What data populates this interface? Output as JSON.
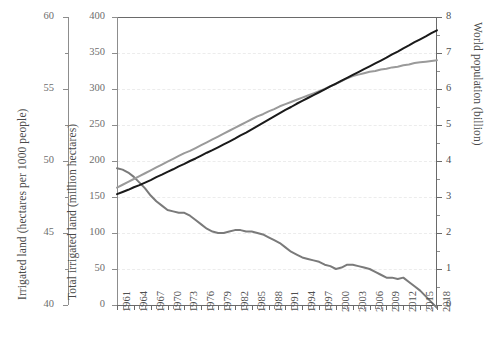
{
  "chart_data": {
    "type": "line",
    "title": "",
    "xlabel": "",
    "x": [
      1961,
      1962,
      1963,
      1964,
      1965,
      1966,
      1967,
      1968,
      1969,
      1970,
      1971,
      1972,
      1973,
      1974,
      1975,
      1976,
      1977,
      1978,
      1979,
      1980,
      1981,
      1982,
      1983,
      1984,
      1985,
      1986,
      1987,
      1988,
      1989,
      1990,
      1991,
      1992,
      1993,
      1994,
      1995,
      1996,
      1997,
      1998,
      1999,
      2000,
      2001,
      2002,
      2003,
      2004,
      2005,
      2006,
      2007,
      2008,
      2009,
      2010,
      2011,
      2012,
      2013,
      2014,
      2015,
      2016,
      2017,
      2018
    ],
    "xtick_labels": [
      "1961",
      "1964",
      "1967",
      "1970",
      "1973",
      "1976",
      "1979",
      "1982",
      "1985",
      "1988",
      "1991",
      "1994",
      "1997",
      "2000",
      "2003",
      "2006",
      "2009",
      "2012",
      "2015",
      "2018"
    ],
    "xtick_step_years": 3,
    "grid": true,
    "grid_style": "horizontal dashed light-grey",
    "legend": "none",
    "axes": [
      {
        "id": "left-secondary",
        "position": "far-left",
        "label": "Irrigated land (hectares per 1000 people)",
        "ticks": [
          40,
          45,
          50,
          55,
          60
        ],
        "minor_ticks": [
          42.5,
          47.5,
          52.5,
          57.5
        ],
        "range": [
          40,
          60
        ]
      },
      {
        "id": "left-primary",
        "position": "left",
        "label": "Total irrigated land (million hectares)",
        "ticks": [
          0,
          50,
          100,
          150,
          200,
          250,
          300,
          350,
          400
        ],
        "range": [
          0,
          400
        ]
      },
      {
        "id": "right",
        "position": "right",
        "label": "World population (billion)",
        "ticks": [
          0,
          1,
          2,
          3,
          4,
          5,
          6,
          7,
          8
        ],
        "minor_ticks": [
          0.5,
          1.5,
          2.5,
          3.5,
          4.5,
          5.5,
          6.5,
          7.5
        ],
        "range": [
          0,
          8
        ]
      }
    ],
    "series": [
      {
        "name": "Irrigated land (hectares per 1000 people)",
        "axis": "left-secondary",
        "color": "#7a7a7a",
        "line_width": 2,
        "values": [
          49.5,
          49.4,
          49.2,
          48.9,
          48.5,
          48.1,
          47.6,
          47.2,
          46.9,
          46.6,
          46.5,
          46.4,
          46.4,
          46.2,
          45.9,
          45.6,
          45.3,
          45.1,
          45.0,
          45.0,
          45.1,
          45.2,
          45.2,
          45.1,
          45.1,
          45.0,
          44.9,
          44.7,
          44.5,
          44.3,
          44.0,
          43.7,
          43.5,
          43.3,
          43.2,
          43.1,
          43.0,
          42.8,
          42.7,
          42.5,
          42.6,
          42.8,
          42.8,
          42.7,
          42.6,
          42.5,
          42.3,
          42.1,
          41.9,
          41.9,
          41.8,
          41.9,
          41.6,
          41.3,
          41.0,
          40.6,
          40.2,
          39.8
        ]
      },
      {
        "name": "Total irrigated land (million hectares)",
        "axis": "left-primary",
        "color": "#9a9a9a",
        "line_width": 2,
        "values": [
          163,
          167,
          171,
          175,
          179,
          183,
          187,
          191,
          195,
          199,
          203,
          207,
          211,
          214,
          218,
          222,
          226,
          230,
          234,
          238,
          242,
          246,
          250,
          254,
          258,
          262,
          265,
          269,
          272,
          276,
          279,
          282,
          285,
          288,
          291,
          294,
          297,
          300,
          304,
          307,
          311,
          315,
          318,
          320,
          322,
          324,
          325,
          327,
          328,
          330,
          331,
          333,
          334,
          336,
          337,
          338,
          339,
          340
        ]
      },
      {
        "name": "World population (billion)",
        "axis": "right",
        "color": "#1a1a1a",
        "line_width": 2,
        "values": [
          3.08,
          3.14,
          3.2,
          3.27,
          3.33,
          3.4,
          3.47,
          3.55,
          3.62,
          3.7,
          3.77,
          3.85,
          3.92,
          4.0,
          4.07,
          4.15,
          4.23,
          4.3,
          4.38,
          4.46,
          4.54,
          4.62,
          4.71,
          4.79,
          4.88,
          4.97,
          5.06,
          5.15,
          5.24,
          5.33,
          5.42,
          5.5,
          5.59,
          5.67,
          5.75,
          5.83,
          5.91,
          5.99,
          6.07,
          6.15,
          6.23,
          6.31,
          6.39,
          6.47,
          6.55,
          6.63,
          6.71,
          6.79,
          6.87,
          6.96,
          7.04,
          7.13,
          7.21,
          7.3,
          7.38,
          7.46,
          7.55,
          7.63
        ]
      }
    ]
  },
  "axis_titles": {
    "left_secondary": "Irrigated land (hectares per 1000 people)",
    "left_primary": "Total irrigated land (million hectares)",
    "right": "World population (billion)"
  },
  "left_secondary_ticks": [
    "60",
    "55",
    "50",
    "45",
    "40"
  ],
  "left_primary_ticks": [
    "400",
    "350",
    "300",
    "250",
    "200",
    "150",
    "100",
    "50",
    "0"
  ],
  "right_ticks": [
    "8",
    "7",
    "6",
    "5",
    "4",
    "3",
    "2",
    "1",
    "0"
  ],
  "x_ticks": [
    "1961",
    "1964",
    "1967",
    "1970",
    "1973",
    "1976",
    "1979",
    "1982",
    "1985",
    "1988",
    "1991",
    "1994",
    "1997",
    "2000",
    "2003",
    "2006",
    "2009",
    "2012",
    "2015",
    "2018"
  ]
}
